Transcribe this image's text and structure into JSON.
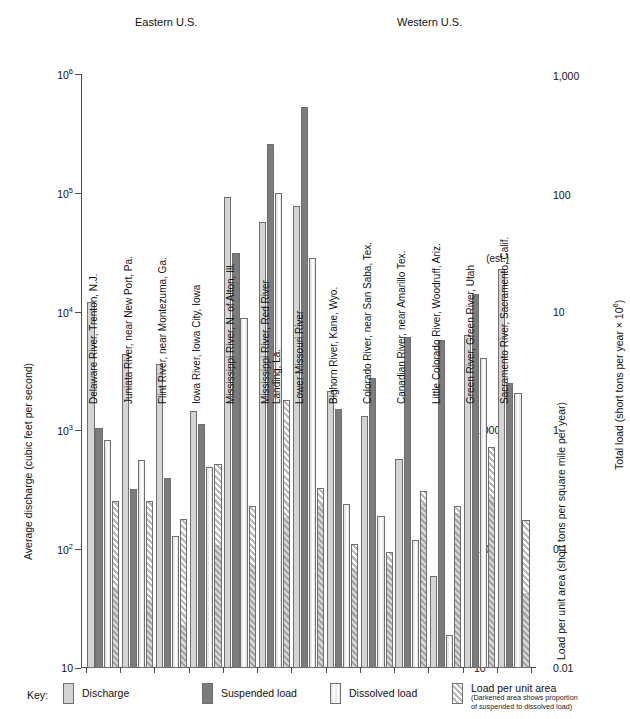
{
  "figure": {
    "regions": [
      {
        "label": "Eastern U.S.",
        "x": 135,
        "y": 22
      },
      {
        "label": "Western U.S.",
        "x": 397,
        "y": 22
      }
    ],
    "estimate_note": {
      "label": "(est.)",
      "group": "Sacramento River, Sacramento, Calif."
    }
  },
  "axes": {
    "left": {
      "title": "Average discharge (cubic feet per second)",
      "ticks": [
        "10⁶",
        "10⁵",
        "10⁴",
        "10³",
        "10²",
        "10"
      ],
      "tick_values": [
        1000000,
        100000,
        10000,
        1000,
        100,
        10
      ],
      "tick_html": [
        "10<sup>6</sup>",
        "10<sup>5</sup>",
        "10<sup>4</sup>",
        "10<sup>3</sup>",
        "10<sup>2</sup>",
        "10"
      ]
    },
    "right_inner": {
      "title": "Load per unit area (short tons per square mile per year)",
      "ticks": [
        "1,000",
        "100",
        "10"
      ],
      "tick_values": [
        1000,
        100,
        10
      ]
    },
    "right_outer": {
      "title": "Total load (short tons per year × 10⁶)",
      "title_html": "Total load (short tons per year × 10<sup>6</sup>)",
      "ticks": [
        "1,000",
        "100",
        "10",
        "1",
        "0.1",
        "0.01"
      ],
      "tick_values": [
        1000,
        100,
        10,
        1,
        0.1,
        0.01
      ]
    }
  },
  "legend": {
    "key_label": "Key:",
    "items": [
      {
        "name": "discharge",
        "label": "Discharge",
        "sub": "",
        "x": 63
      },
      {
        "name": "suspended",
        "label": "Suspended load",
        "sub": "",
        "x": 202
      },
      {
        "name": "dissolved",
        "label": "Dissolved load",
        "sub": "",
        "x": 330
      },
      {
        "name": "lpua",
        "label": "Load per unit area",
        "sub1": "(Darkened area shows proportion",
        "sub2": "of suspended to dissolved load)",
        "x": 452
      }
    ]
  },
  "colors": {
    "discharge": "#d4d4d4",
    "suspended": "#7c7c7c",
    "dissolved": "#e9e9e9",
    "load_per_unit_area": "#b9b9b9",
    "axis": "#4d4d4d",
    "background": "#ffffff"
  },
  "chart_data": {
    "type": "bar",
    "title": "",
    "xlabel": "",
    "ylabel": "Average discharge (cubic feet per second)",
    "scale": "log",
    "ylim": [
      10,
      1000000
    ],
    "grid": false,
    "legend_position": "bottom",
    "series": [
      {
        "name": "Discharge",
        "unit": "cubic feet per second"
      },
      {
        "name": "Suspended load",
        "unit": "short tons per year × 10⁶"
      },
      {
        "name": "Dissolved load",
        "unit": "short tons per year × 10⁶"
      },
      {
        "name": "Load per unit area",
        "unit": "short tons per square mile per year"
      }
    ],
    "categories": [
      "Delaware River, Trenton, N.J.",
      "Juniata River, near New Port, Pa.",
      "Flint River, near Montezuma, Ga.",
      "Iowa River, Iowa City, Iowa",
      "Mississippi River, N. of Alton, Ill.",
      "Mississippi River, Red River Landing, La.",
      "Lower Missouri River",
      "Bighorn River, Kane, Wyo.",
      "Colorado River, near San Saba, Tex.",
      "Canadian River, near Amarillo Tex.",
      "Little Colorado River, Woodruff, Ariz.",
      "Green River, Green River, Utah",
      "Sacramento River, Sacramento, Calif."
    ],
    "region_of": [
      "Eastern U.S.",
      "Eastern U.S.",
      "Eastern U.S.",
      "Eastern U.S.",
      "Eastern U.S.",
      "Eastern U.S.",
      "Eastern U.S.",
      "Western U.S.",
      "Western U.S.",
      "Western U.S.",
      "Western U.S.",
      "Western U.S.",
      "Western U.S."
    ],
    "bars": [
      {
        "category": "Delaware River, Trenton, N.J.",
        "discharge": 12000,
        "suspended": 1050,
        "dissolved": 830,
        "load_per_unit_area": 255,
        "lpua_dark_fraction": 0.48
      },
      {
        "category": "Juniata River, near New Port, Pa.",
        "discharge": 4400,
        "suspended": 320,
        "dissolved": 560,
        "load_per_unit_area": 255,
        "lpua_dark_fraction": 0.4
      },
      {
        "category": "Flint River, near Montezuma, Ga.",
        "discharge": 3600,
        "suspended": 400,
        "dissolved": 130,
        "load_per_unit_area": 180,
        "lpua_dark_fraction": 0.28
      },
      {
        "category": "Iowa River, Iowa City, Iowa",
        "discharge": 1450,
        "suspended": 1130,
        "dissolved": 490,
        "load_per_unit_area": 520,
        "lpua_dark_fraction": 0.6
      },
      {
        "category": "Mississippi River, N. of Alton, Ill.",
        "discharge": 92000,
        "suspended": 31000,
        "dissolved": 8800,
        "load_per_unit_area": 230,
        "lpua_dark_fraction": 0.63
      },
      {
        "category": "Mississippi River, Red River Landing, La.",
        "discharge": 57000,
        "suspended": 260000,
        "dissolved": 100000,
        "load_per_unit_area": 1800,
        "lpua_dark_fraction": 0.56
      },
      {
        "category": "Lower Missouri River",
        "discharge": 77000,
        "suspended": 530000,
        "dissolved": 28000,
        "load_per_unit_area": 330,
        "lpua_dark_fraction": 0.9
      },
      {
        "category": "Bighorn River, Kane, Wyo.",
        "discharge": 2150,
        "suspended": 1500,
        "dissolved": 240,
        "load_per_unit_area": 110,
        "lpua_dark_fraction": 0.8
      },
      {
        "category": "Colorado River, near San Saba, Tex.",
        "discharge": 1320,
        "suspended": 2750,
        "dissolved": 190,
        "load_per_unit_area": 95,
        "lpua_dark_fraction": 0.88
      },
      {
        "category": "Canadian River, near Amarillo Tex.",
        "discharge": 570,
        "suspended": 6100,
        "dissolved": 120,
        "load_per_unit_area": 310,
        "lpua_dark_fraction": 0.92
      },
      {
        "category": "Little Colorado River, Woodruff, Ariz.",
        "discharge": 59,
        "suspended": 5800,
        "dissolved": 19,
        "load_per_unit_area": 230,
        "lpua_dark_fraction": 0.95
      },
      {
        "category": "Green River, Green River, Utah",
        "discharge": 6300,
        "suspended": 14000,
        "dissolved": 4100,
        "load_per_unit_area": 720,
        "lpua_dark_fraction": 0.77
      },
      {
        "category": "Sacramento River, Sacramento, Calif.",
        "discharge": 23000,
        "suspended": 2500,
        "dissolved": 2050,
        "load_per_unit_area": 175,
        "lpua_dark_fraction": 0.5
      }
    ]
  }
}
